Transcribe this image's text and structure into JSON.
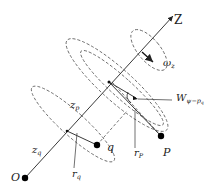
{
  "diagram": {
    "type": "geometric schematic",
    "axis": {
      "label": "Z"
    },
    "angular_velocity": {
      "label": "ω",
      "sub": "z"
    },
    "points": {
      "origin": {
        "label": "O"
      },
      "q": {
        "label": "q"
      },
      "P": {
        "label": "P"
      }
    },
    "distances": {
      "z_p": {
        "label": "z",
        "sub": "p"
      },
      "z_q": {
        "label": "z",
        "sub": "q"
      },
      "r_q": {
        "label": "r",
        "sub": "q"
      },
      "r_P": {
        "label": "r",
        "sub": "P"
      }
    },
    "angle": {
      "label": "W",
      "sub": "ψ−p",
      "subsub": "q"
    },
    "colors": {
      "line": "#222222",
      "dashed": "#555555",
      "point": "#000000"
    }
  }
}
